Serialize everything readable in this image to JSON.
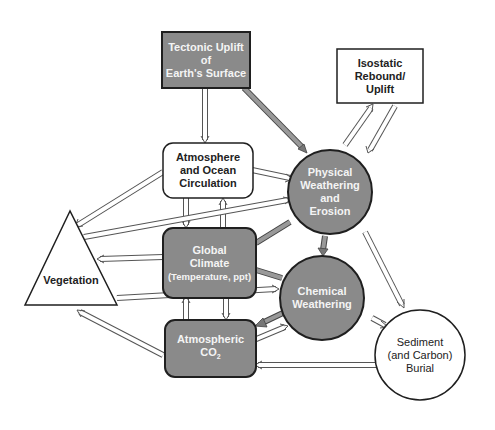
{
  "colors": {
    "shaded_fill": "#8a8a8a",
    "light_fill": "#ffffff",
    "outline": "#1f1f1f",
    "arrow_outline": "#555555"
  },
  "nodes": {
    "tectonic": {
      "line1": "Tectonic Uplift",
      "line2": "of",
      "line3": "Earth's Surface",
      "shape": "rectangle",
      "shaded": true
    },
    "isostatic": {
      "line1": "Isostatic",
      "line2": "Rebound/",
      "line3": "Uplift",
      "shape": "rectangle",
      "shaded": false
    },
    "atmosphere_ocean": {
      "line1": "Atmosphere",
      "line2": "and Ocean",
      "line3": "Circulation",
      "shape": "rounded-rectangle",
      "shaded": false
    },
    "physical_weathering": {
      "line1": "Physical",
      "line2": "Weathering",
      "line3": "and",
      "line4": "Erosion",
      "shape": "circle",
      "shaded": true
    },
    "vegetation": {
      "line1": "Vegetation",
      "shape": "triangle",
      "shaded": false
    },
    "global_climate": {
      "line1": "Global",
      "line2": "Climate",
      "line3": "(Temperature, ppt)",
      "shape": "rounded-rectangle",
      "shaded": true
    },
    "chemical_weathering": {
      "line1": "Chemical",
      "line2": "Weathering",
      "shape": "circle",
      "shaded": true
    },
    "atmospheric_co2": {
      "line1": "Atmospheric",
      "line2": "CO",
      "line2_sub": "2",
      "shape": "rounded-rectangle",
      "shaded": true
    },
    "sediment": {
      "line1": "Sediment",
      "line2": "(and Carbon)",
      "line3": "Burial",
      "shape": "circle",
      "shaded": false
    }
  },
  "connections": [
    {
      "from": "tectonic",
      "to": "atmosphere_ocean",
      "style": "open"
    },
    {
      "from": "tectonic",
      "to": "physical_weathering",
      "style": "shaded"
    },
    {
      "from": "physical_weathering",
      "to": "isostatic",
      "style": "open"
    },
    {
      "from": "isostatic",
      "to": "physical_weathering",
      "style": "open"
    },
    {
      "from": "atmosphere_ocean",
      "to": "physical_weathering",
      "style": "open"
    },
    {
      "from": "atmosphere_ocean",
      "to": "vegetation",
      "style": "open"
    },
    {
      "from": "atmosphere_ocean",
      "to": "global_climate",
      "style": "open"
    },
    {
      "from": "global_climate",
      "to": "atmosphere_ocean",
      "style": "open"
    },
    {
      "from": "vegetation",
      "to": "physical_weathering",
      "style": "open"
    },
    {
      "from": "global_climate",
      "to": "vegetation",
      "style": "open"
    },
    {
      "from": "global_climate",
      "to": "physical_weathering",
      "style": "shaded"
    },
    {
      "from": "global_climate",
      "to": "chemical_weathering",
      "style": "shaded"
    },
    {
      "from": "physical_weathering",
      "to": "chemical_weathering",
      "style": "shaded"
    },
    {
      "from": "vegetation",
      "to": "chemical_weathering",
      "style": "open"
    },
    {
      "from": "global_climate",
      "to": "atmospheric_co2",
      "style": "open"
    },
    {
      "from": "atmospheric_co2",
      "to": "global_climate",
      "style": "open"
    },
    {
      "from": "atmospheric_co2",
      "to": "vegetation",
      "style": "open"
    },
    {
      "from": "chemical_weathering",
      "to": "atmospheric_co2",
      "style": "shaded"
    },
    {
      "from": "atmospheric_co2",
      "to": "chemical_weathering",
      "style": "open"
    },
    {
      "from": "sediment",
      "to": "atmospheric_co2",
      "style": "open"
    },
    {
      "from": "physical_weathering",
      "to": "sediment",
      "style": "open"
    },
    {
      "from": "chemical_weathering",
      "to": "sediment",
      "style": "open"
    }
  ]
}
